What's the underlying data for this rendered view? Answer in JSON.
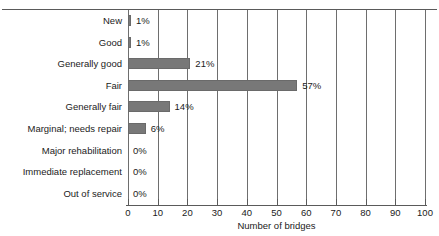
{
  "chart_data": {
    "type": "bar",
    "orientation": "horizontal",
    "title": "",
    "xlabel": "Number of bridges",
    "ylabel": "",
    "xlim": [
      0,
      100
    ],
    "xticks": [
      0,
      10,
      20,
      30,
      40,
      50,
      60,
      70,
      80,
      90,
      100
    ],
    "xtick_labels": [
      "0",
      "10",
      "20",
      "30",
      "40",
      "50",
      "60",
      "70",
      "80",
      "90",
      "100"
    ],
    "grid": true,
    "grid_axis": "x",
    "legend": false,
    "bar_color": "#787878",
    "categories": [
      "New",
      "Good",
      "Generally good",
      "Fair",
      "Generally fair",
      "Marginal; needs repair",
      "Major rehabilitation",
      "Immediate replacement",
      "Out of service"
    ],
    "values": [
      1,
      1,
      21,
      57,
      14,
      6,
      0,
      0,
      0
    ],
    "data_labels": [
      "1%",
      "1%",
      "21%",
      "57%",
      "14%",
      "6%",
      "0%",
      "0%",
      "0%"
    ]
  },
  "axis": {
    "xtitle": "Number of bridges"
  }
}
